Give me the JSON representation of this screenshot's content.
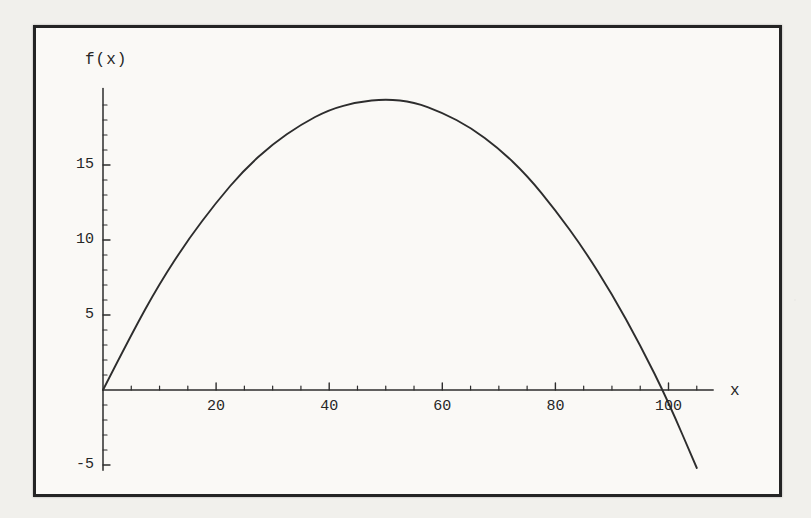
{
  "page": {
    "background": "#f1f0ec"
  },
  "frame": {
    "border_color": "#242424",
    "background": "#faf9f6"
  },
  "chart_data": {
    "type": "line",
    "title": "",
    "xlabel": "x",
    "ylabel": "f(x)",
    "x_ticks": [
      20,
      40,
      60,
      80,
      100
    ],
    "y_ticks": [
      -5,
      5,
      10,
      15
    ],
    "x_minor_step": 5,
    "y_minor_step": 1,
    "xlim": [
      0,
      107.9
    ],
    "ylim": [
      -5.35,
      20.1
    ],
    "grid": false,
    "legend": false,
    "ink_color": "#2d2d2d",
    "series": [
      {
        "name": "f(x)",
        "x": [
          0,
          5,
          10,
          15,
          20,
          25,
          30,
          35,
          40,
          45,
          50,
          55,
          60,
          65,
          70,
          75,
          80,
          85,
          90,
          95,
          100,
          105
        ],
        "y": [
          0,
          3.7,
          7.1,
          10.0,
          12.5,
          14.7,
          16.4,
          17.7,
          18.7,
          19.2,
          19.4,
          19.2,
          18.5,
          17.5,
          16.1,
          14.3,
          12.0,
          9.4,
          6.4,
          3.0,
          -0.8,
          -5.2
        ]
      }
    ]
  }
}
